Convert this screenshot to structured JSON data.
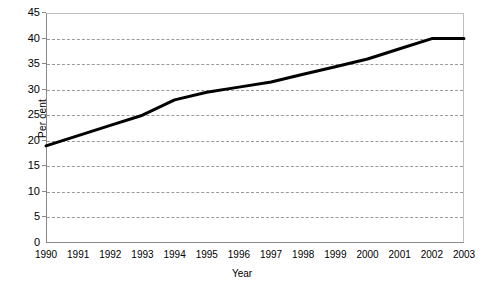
{
  "chart_data": {
    "type": "line",
    "title": "",
    "xlabel": "Year",
    "ylabel": "Per cent",
    "categories": [
      "1990",
      "1991",
      "1992",
      "1993",
      "1994",
      "1995",
      "1996",
      "1997",
      "1998",
      "1999",
      "2000",
      "2001",
      "2002",
      "2003"
    ],
    "x": [
      1990,
      1991,
      1992,
      1993,
      1994,
      1995,
      1996,
      1997,
      1998,
      1999,
      2000,
      2001,
      2002,
      2003
    ],
    "values": [
      19,
      21,
      23,
      25,
      28,
      29.5,
      30.5,
      31.5,
      33,
      34.5,
      36,
      38,
      40,
      40
    ],
    "series": [
      {
        "name": "Per cent",
        "color": "#000000",
        "values": [
          19,
          21,
          23,
          25,
          28,
          29.5,
          30.5,
          31.5,
          33,
          34.5,
          36,
          38,
          40,
          40
        ]
      }
    ],
    "ylim": [
      0,
      45
    ],
    "ytick_values": [
      0,
      5,
      10,
      15,
      20,
      25,
      30,
      35,
      40,
      45
    ],
    "ytick_labels": [
      "0",
      "5",
      "10",
      "15",
      "20",
      "25",
      "30",
      "35",
      "40",
      "45"
    ],
    "xlim": [
      1990,
      2003
    ],
    "grid": "horizontal-dashed",
    "legend": "none",
    "gridline_color": "#9a9a9a",
    "axis_color": "#8a8a8a",
    "line_color": "#000000",
    "line_width_px": 3,
    "background": "#ffffff"
  }
}
